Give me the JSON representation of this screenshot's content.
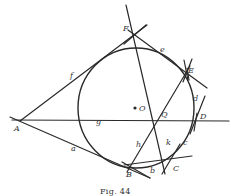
{
  "figure": {
    "caption": "Fig. 44",
    "center_label": "O",
    "points": {
      "A": "A",
      "B": "B",
      "C": "C",
      "D": "D",
      "E": "E",
      "F": "F",
      "Q": "Q"
    },
    "lines": {
      "a": "a",
      "b": "b",
      "c": "c",
      "d": "d",
      "e": "e",
      "f": "f",
      "g": "g",
      "h": "h",
      "k": "k"
    }
  }
}
